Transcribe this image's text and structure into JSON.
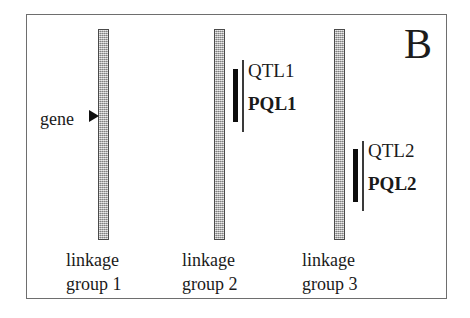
{
  "figure": {
    "panel_letter": "B",
    "background_color": "#ffffff",
    "frame_color": "#6e6e6e",
    "bar_fill_color": "#a9a9a9",
    "bar_border_color": "#4a4a4a",
    "marker_color": "#0d0d0d",
    "text_color": "#1a1a1a"
  },
  "gene_annotation": {
    "label": "gene",
    "arrow_icon": "right-triangle-arrow-icon",
    "points_to": "linkage group 1"
  },
  "linkage_groups": [
    {
      "id": "linkage-group-1",
      "caption_line1": "linkage",
      "caption_line2": "group 1",
      "markers": []
    },
    {
      "id": "linkage-group-2",
      "caption_line1": "linkage",
      "caption_line2": "group 2",
      "markers": [
        {
          "qtl_label": "QTL1",
          "pql_label": "PQL1"
        }
      ]
    },
    {
      "id": "linkage-group-3",
      "caption_line1": "linkage",
      "caption_line2": "group 3",
      "markers": [
        {
          "qtl_label": "QTL2",
          "pql_label": "PQL2"
        }
      ]
    }
  ]
}
